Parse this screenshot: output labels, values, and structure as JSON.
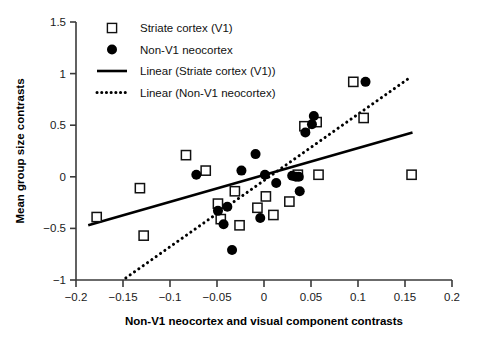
{
  "chart_data": {
    "type": "scatter",
    "title": "",
    "xlabel": "Non-V1 neocortex and visual component contrasts",
    "ylabel": "Mean group size contrasts",
    "xlim": [
      -0.2,
      0.2
    ],
    "ylim": [
      -1,
      1.5
    ],
    "xticks": [
      -0.2,
      -0.15,
      -0.1,
      -0.05,
      0,
      0.05,
      0.1,
      0.15,
      0.2
    ],
    "xtick_labels": [
      "−0.2",
      "−0.15",
      "−0.1",
      "−0.05",
      "0",
      "0.05",
      "0.1",
      "0.15",
      "0.2"
    ],
    "yticks": [
      -1,
      -0.5,
      0,
      0.5,
      1,
      1.5
    ],
    "ytick_labels": [
      "−1",
      "−0.5",
      "0",
      "0.5",
      "1",
      "1.5"
    ],
    "grid": false,
    "legend_position": "top-left",
    "legend": [
      {
        "label": "Striate cortex (V1)",
        "marker": "open-square",
        "color": "#000000"
      },
      {
        "label": "Non-V1 neocortex",
        "marker": "filled-circle",
        "color": "#000000"
      },
      {
        "label": "Linear (Striate cortex (V1))",
        "marker": "solid-line",
        "color": "#000000"
      },
      {
        "label": "Linear (Non-V1 neocortex)",
        "marker": "dotted-line",
        "color": "#000000"
      }
    ],
    "series": [
      {
        "name": "Striate cortex (V1)",
        "marker": "open-square",
        "points": [
          [
            -0.178,
            -0.39
          ],
          [
            -0.132,
            -0.11
          ],
          [
            -0.128,
            -0.57
          ],
          [
            -0.083,
            0.21
          ],
          [
            -0.062,
            0.06
          ],
          [
            -0.049,
            -0.26
          ],
          [
            -0.046,
            -0.41
          ],
          [
            -0.031,
            -0.14
          ],
          [
            -0.026,
            -0.47
          ],
          [
            -0.007,
            -0.3
          ],
          [
            0.002,
            -0.19
          ],
          [
            0.01,
            -0.37
          ],
          [
            0.027,
            -0.24
          ],
          [
            0.036,
            0.02
          ],
          [
            0.043,
            0.49
          ],
          [
            0.056,
            0.53
          ],
          [
            0.058,
            0.02
          ],
          [
            0.095,
            0.92
          ],
          [
            0.106,
            0.57
          ],
          [
            0.157,
            0.02
          ]
        ]
      },
      {
        "name": "Non-V1 neocortex",
        "marker": "filled-circle",
        "points": [
          [
            -0.072,
            0.02
          ],
          [
            -0.049,
            -0.33
          ],
          [
            -0.043,
            -0.46
          ],
          [
            -0.039,
            -0.29
          ],
          [
            -0.034,
            -0.71
          ],
          [
            -0.024,
            0.06
          ],
          [
            -0.009,
            0.22
          ],
          [
            -0.004,
            -0.4
          ],
          [
            0.001,
            0.02
          ],
          [
            0.013,
            -0.06
          ],
          [
            0.03,
            0.01
          ],
          [
            0.034,
            0.0
          ],
          [
            0.037,
            0.0
          ],
          [
            0.038,
            -0.14
          ],
          [
            0.044,
            0.43
          ],
          [
            0.051,
            0.51
          ],
          [
            0.053,
            0.59
          ],
          [
            0.108,
            0.92
          ]
        ]
      }
    ],
    "trendlines": [
      {
        "name": "Linear (Striate cortex (V1))",
        "style": "solid",
        "x_start": -0.187,
        "y_start": -0.47,
        "x_end": 0.158,
        "y_end": 0.43
      },
      {
        "name": "Linear (Non-V1 neocortex)",
        "style": "dotted",
        "x_start": -0.147,
        "y_start": -0.98,
        "x_end": 0.155,
        "y_end": 0.96
      }
    ]
  }
}
